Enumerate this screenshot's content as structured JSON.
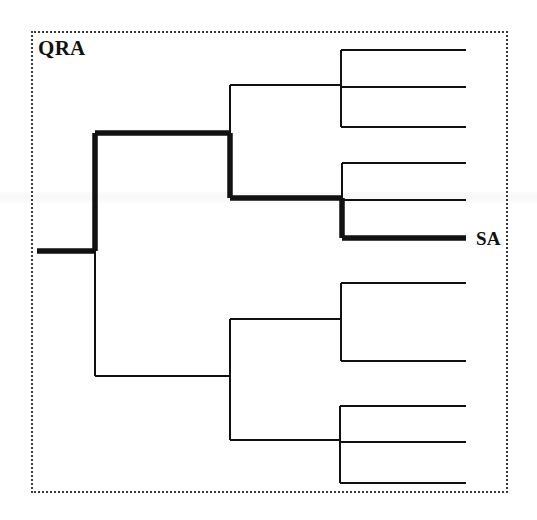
{
  "figure": {
    "kind": "dendrogram",
    "border_style": "dotted",
    "border_color": "#3a3a3a",
    "background_color": "#ffffff",
    "line_color": "#111111",
    "thin_stroke_px": 2,
    "bold_stroke_px": 5.5,
    "width_px": 537,
    "height_px": 520
  },
  "labels": {
    "qra": "QRA",
    "sa": "SA"
  },
  "chart_data": {
    "type": "tree",
    "title": "",
    "highlighted_path_label": "SA",
    "clade_label": "QRA",
    "root": {
      "x": 37,
      "y": 251
    },
    "leaf_tip_x": 466,
    "leaf_count": 11,
    "highlighted_leaf_index": 7,
    "nodes": [
      {
        "id": "root-stem",
        "x1": 37,
        "y1": 251,
        "x2": 95,
        "y2": 251,
        "bold": true
      },
      {
        "id": "root-vertical",
        "x1": 95,
        "y1": 133,
        "x2": 95,
        "y2": 376,
        "bold": false
      },
      {
        "id": "root-vertical-bold",
        "x1": 95,
        "y1": 133,
        "x2": 95,
        "y2": 251,
        "bold": true
      },
      {
        "id": "upper-branch",
        "x1": 95,
        "y1": 133,
        "x2": 230,
        "y2": 133,
        "bold": true
      },
      {
        "id": "upper-vertical",
        "x1": 230,
        "y1": 85,
        "x2": 230,
        "y2": 198,
        "bold": false
      },
      {
        "id": "upper-vertical-bold",
        "x1": 230,
        "y1": 133,
        "x2": 230,
        "y2": 198,
        "bold": true
      },
      {
        "id": "cladeA-branch",
        "x1": 230,
        "y1": 85,
        "x2": 341,
        "y2": 85,
        "bold": false
      },
      {
        "id": "cladeA-vertical",
        "x1": 341,
        "y1": 50,
        "x2": 341,
        "y2": 127,
        "bold": false
      },
      {
        "id": "cladeA-leaf-1",
        "x1": 341,
        "y1": 50,
        "x2": 466,
        "y2": 50,
        "bold": false
      },
      {
        "id": "cladeA-leaf-2",
        "x1": 341,
        "y1": 87,
        "x2": 466,
        "y2": 87,
        "bold": false
      },
      {
        "id": "cladeA-leaf-3",
        "x1": 341,
        "y1": 127,
        "x2": 466,
        "y2": 127,
        "bold": false
      },
      {
        "id": "cladeB-branch",
        "x1": 230,
        "y1": 198,
        "x2": 342,
        "y2": 198,
        "bold": true
      },
      {
        "id": "cladeB-vertical",
        "x1": 342,
        "y1": 163,
        "x2": 342,
        "y2": 238,
        "bold": false
      },
      {
        "id": "cladeB-vertical-bold",
        "x1": 342,
        "y1": 198,
        "x2": 342,
        "y2": 238,
        "bold": true
      },
      {
        "id": "cladeB-leaf-1",
        "x1": 342,
        "y1": 163,
        "x2": 466,
        "y2": 163,
        "bold": false
      },
      {
        "id": "cladeB-leaf-2",
        "x1": 342,
        "y1": 200,
        "x2": 466,
        "y2": 200,
        "bold": false
      },
      {
        "id": "cladeB-leaf-3-SA",
        "x1": 342,
        "y1": 238,
        "x2": 466,
        "y2": 238,
        "bold": true
      },
      {
        "id": "lower-branch",
        "x1": 95,
        "y1": 376,
        "x2": 230,
        "y2": 376,
        "bold": false
      },
      {
        "id": "lower-vertical",
        "x1": 230,
        "y1": 319,
        "x2": 230,
        "y2": 440,
        "bold": false
      },
      {
        "id": "cladeC-branch",
        "x1": 230,
        "y1": 319,
        "x2": 341,
        "y2": 319,
        "bold": false
      },
      {
        "id": "cladeC-vertical",
        "x1": 341,
        "y1": 283,
        "x2": 341,
        "y2": 361,
        "bold": false
      },
      {
        "id": "cladeC-leaf-1",
        "x1": 341,
        "y1": 283,
        "x2": 466,
        "y2": 283,
        "bold": false
      },
      {
        "id": "cladeC-leaf-2",
        "x1": 341,
        "y1": 361,
        "x2": 466,
        "y2": 361,
        "bold": false
      },
      {
        "id": "cladeD-branch",
        "x1": 230,
        "y1": 440,
        "x2": 340,
        "y2": 440,
        "bold": false
      },
      {
        "id": "cladeD-vertical",
        "x1": 340,
        "y1": 406,
        "x2": 340,
        "y2": 483,
        "bold": false
      },
      {
        "id": "cladeD-leaf-1",
        "x1": 340,
        "y1": 406,
        "x2": 466,
        "y2": 406,
        "bold": false
      },
      {
        "id": "cladeD-leaf-2",
        "x1": 340,
        "y1": 442,
        "x2": 466,
        "y2": 442,
        "bold": false
      },
      {
        "id": "cladeD-leaf-3",
        "x1": 340,
        "y1": 483,
        "x2": 466,
        "y2": 483,
        "bold": false
      }
    ]
  }
}
